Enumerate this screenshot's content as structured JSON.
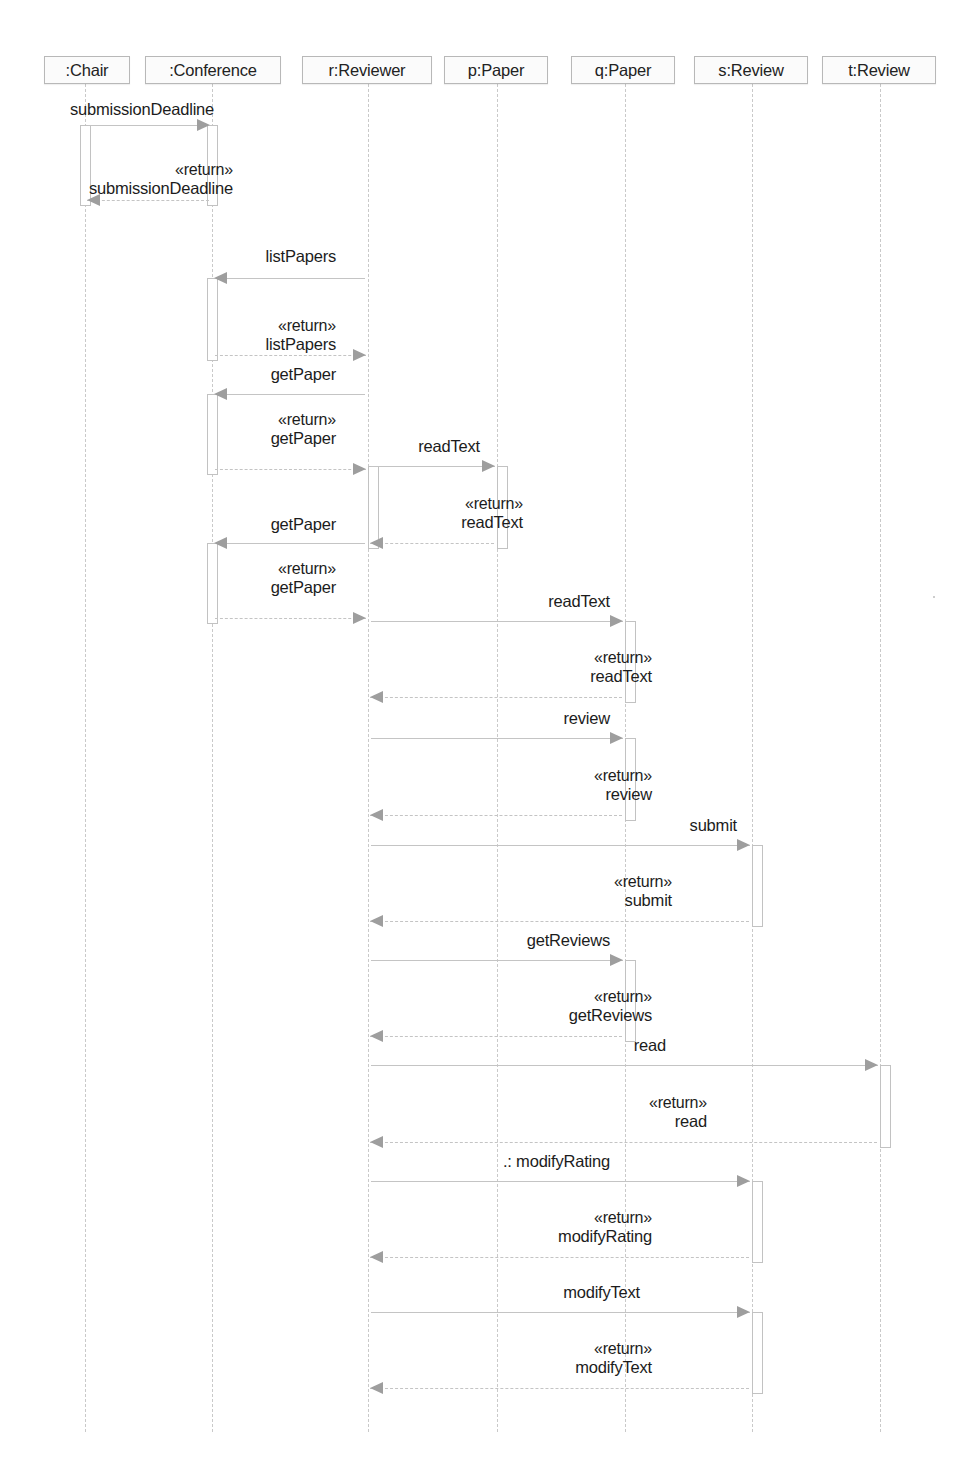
{
  "diagram": {
    "kind": "uml-sequence-diagram",
    "width": 966,
    "height": 1467,
    "colors": {
      "line": "#c4c4c4",
      "arrow": "#9e9e9e",
      "head_border": "#b8b8b8",
      "head_fill": "#fbfbfb",
      "text": "#1c1c1c",
      "background": "#ffffff"
    }
  },
  "lifelines": [
    {
      "id": "chair",
      "label": ":Chair",
      "x": 85,
      "box_left": 44,
      "box_width": 86
    },
    {
      "id": "conference",
      "label": ":Conference",
      "x": 212,
      "box_left": 145,
      "box_width": 136
    },
    {
      "id": "reviewer",
      "label": "r:Reviewer",
      "x": 368,
      "box_left": 302,
      "box_width": 130
    },
    {
      "id": "ppaper",
      "label": "p:Paper",
      "x": 497,
      "box_left": 444,
      "box_width": 104
    },
    {
      "id": "qpaper",
      "label": "q:Paper",
      "x": 625,
      "box_left": 571,
      "box_width": 104
    },
    {
      "id": "sreview",
      "label": "s:Review",
      "x": 752,
      "box_left": 694,
      "box_width": 114
    },
    {
      "id": "treview",
      "label": "t:Review",
      "x": 880,
      "box_left": 822,
      "box_width": 114
    }
  ],
  "messages": [
    {
      "seq": 1,
      "name": "submissionDeadline",
      "stereotype": "",
      "from": "chair",
      "to": "conference",
      "dir": "right",
      "y": 125,
      "label_x": 70,
      "label_y": 100,
      "align": "left"
    },
    {
      "seq": 2,
      "name": "submissionDeadline",
      "stereotype": "«return»",
      "from": "conference",
      "to": "chair",
      "dir": "left",
      "y": 200,
      "label_x": 233,
      "label_y": 160,
      "align": "right"
    },
    {
      "seq": 3,
      "name": "listPapers",
      "stereotype": "",
      "from": "reviewer",
      "to": "conference",
      "dir": "left",
      "y": 278,
      "label_x": 336,
      "label_y": 247,
      "align": "right"
    },
    {
      "seq": 4,
      "name": "listPapers",
      "stereotype": "«return»",
      "from": "conference",
      "to": "reviewer",
      "dir": "right",
      "y": 355,
      "label_x": 336,
      "label_y": 316,
      "align": "right"
    },
    {
      "seq": 5,
      "name": "getPaper",
      "stereotype": "",
      "from": "reviewer",
      "to": "conference",
      "dir": "left",
      "y": 394,
      "label_x": 336,
      "label_y": 365,
      "align": "right"
    },
    {
      "seq": 6,
      "name": "getPaper",
      "stereotype": "«return»",
      "from": "conference",
      "to": "reviewer",
      "dir": "right",
      "y": 469,
      "label_x": 336,
      "label_y": 410,
      "align": "right"
    },
    {
      "seq": 7,
      "name": "readText",
      "stereotype": "",
      "from": "reviewer",
      "to": "ppaper",
      "dir": "right",
      "y": 466,
      "label_x": 480,
      "label_y": 437,
      "align": "right"
    },
    {
      "seq": 8,
      "name": "readText",
      "stereotype": "«return»",
      "from": "ppaper",
      "to": "reviewer",
      "dir": "left",
      "y": 543,
      "label_x": 523,
      "label_y": 494,
      "align": "right"
    },
    {
      "seq": 9,
      "name": "getPaper",
      "stereotype": "",
      "from": "reviewer",
      "to": "conference",
      "dir": "left",
      "y": 543,
      "label_x": 336,
      "label_y": 515,
      "align": "right"
    },
    {
      "seq": 10,
      "name": "getPaper",
      "stereotype": "«return»",
      "from": "conference",
      "to": "reviewer",
      "dir": "right",
      "y": 618,
      "label_x": 336,
      "label_y": 559,
      "align": "right"
    },
    {
      "seq": 11,
      "name": "readText",
      "stereotype": "",
      "from": "reviewer",
      "to": "qpaper",
      "dir": "right",
      "y": 621,
      "label_x": 610,
      "label_y": 592,
      "align": "right"
    },
    {
      "seq": 12,
      "name": "readText",
      "stereotype": "«return»",
      "from": "qpaper",
      "to": "reviewer",
      "dir": "left",
      "y": 697,
      "label_x": 652,
      "label_y": 648,
      "align": "right"
    },
    {
      "seq": 13,
      "name": "review",
      "stereotype": "",
      "from": "reviewer",
      "to": "qpaper",
      "dir": "right",
      "y": 738,
      "label_x": 610,
      "label_y": 709,
      "align": "right"
    },
    {
      "seq": 14,
      "name": "review",
      "stereotype": "«return»",
      "from": "qpaper",
      "to": "reviewer",
      "dir": "left",
      "y": 815,
      "label_x": 652,
      "label_y": 766,
      "align": "right"
    },
    {
      "seq": 15,
      "name": "submit",
      "stereotype": "",
      "from": "reviewer",
      "to": "sreview",
      "dir": "right",
      "y": 845,
      "label_x": 737,
      "label_y": 816,
      "align": "right"
    },
    {
      "seq": 16,
      "name": "submit",
      "stereotype": "«return»",
      "from": "sreview",
      "to": "reviewer",
      "dir": "left",
      "y": 921,
      "label_x": 672,
      "label_y": 872,
      "align": "right"
    },
    {
      "seq": 17,
      "name": "getReviews",
      "stereotype": "",
      "from": "reviewer",
      "to": "qpaper",
      "dir": "right",
      "y": 960,
      "label_x": 610,
      "label_y": 931,
      "align": "right"
    },
    {
      "seq": 18,
      "name": "getReviews",
      "stereotype": "«return»",
      "from": "qpaper",
      "to": "reviewer",
      "dir": "left",
      "y": 1036,
      "label_x": 652,
      "label_y": 987,
      "align": "right"
    },
    {
      "seq": 19,
      "name": "read",
      "stereotype": "",
      "from": "reviewer",
      "to": "treview",
      "dir": "right",
      "y": 1065,
      "label_x": 666,
      "label_y": 1036,
      "align": "right"
    },
    {
      "seq": 20,
      "name": "read",
      "stereotype": "«return»",
      "from": "treview",
      "to": "reviewer",
      "dir": "left",
      "y": 1142,
      "label_x": 707,
      "label_y": 1093,
      "align": "right"
    },
    {
      "seq": 21,
      "name": ".: modifyRating",
      "stereotype": "",
      "from": "reviewer",
      "to": "sreview",
      "dir": "right",
      "y": 1181,
      "label_x": 610,
      "label_y": 1152,
      "align": "right"
    },
    {
      "seq": 22,
      "name": "modifyRating",
      "stereotype": "«return»",
      "from": "sreview",
      "to": "reviewer",
      "dir": "left",
      "y": 1257,
      "label_x": 652,
      "label_y": 1208,
      "align": "right"
    },
    {
      "seq": 23,
      "name": "modifyText",
      "stereotype": "",
      "from": "reviewer",
      "to": "sreview",
      "dir": "right",
      "y": 1312,
      "label_x": 640,
      "label_y": 1283,
      "align": "right"
    },
    {
      "seq": 24,
      "name": "modifyText",
      "stereotype": "«return»",
      "from": "sreview",
      "to": "reviewer",
      "dir": "left",
      "y": 1388,
      "label_x": 652,
      "label_y": 1339,
      "align": "right"
    }
  ],
  "activations": [
    {
      "id": "act-chair-1",
      "lifeline": "chair",
      "top": 125,
      "bottom": 206,
      "side": "center"
    },
    {
      "id": "act-conf-1",
      "lifeline": "conference",
      "top": 125,
      "bottom": 206,
      "side": "center"
    },
    {
      "id": "act-conf-2",
      "lifeline": "conference",
      "top": 278,
      "bottom": 361,
      "side": "center"
    },
    {
      "id": "act-conf-3",
      "lifeline": "conference",
      "top": 394,
      "bottom": 475,
      "side": "center"
    },
    {
      "id": "act-conf-4",
      "lifeline": "conference",
      "top": 543,
      "bottom": 624,
      "side": "center"
    },
    {
      "id": "act-reviewer-1",
      "lifeline": "reviewer",
      "top": 466,
      "bottom": 549,
      "side": "right"
    },
    {
      "id": "act-ppaper-1",
      "lifeline": "ppaper",
      "top": 466,
      "bottom": 549,
      "side": "right"
    },
    {
      "id": "act-qpaper-1",
      "lifeline": "qpaper",
      "top": 621,
      "bottom": 703,
      "side": "right"
    },
    {
      "id": "act-qpaper-2",
      "lifeline": "qpaper",
      "top": 738,
      "bottom": 821,
      "side": "right"
    },
    {
      "id": "act-sreview-1",
      "lifeline": "sreview",
      "top": 845,
      "bottom": 927,
      "side": "right"
    },
    {
      "id": "act-qpaper-3",
      "lifeline": "qpaper",
      "top": 960,
      "bottom": 1042,
      "side": "right"
    },
    {
      "id": "act-treview-1",
      "lifeline": "treview",
      "top": 1065,
      "bottom": 1148,
      "side": "right"
    },
    {
      "id": "act-sreview-2",
      "lifeline": "sreview",
      "top": 1181,
      "bottom": 1263,
      "side": "right"
    },
    {
      "id": "act-sreview-3",
      "lifeline": "sreview",
      "top": 1312,
      "bottom": 1394,
      "side": "right"
    }
  ],
  "lifeline_extent": {
    "top": 84,
    "bottom": 1432
  }
}
